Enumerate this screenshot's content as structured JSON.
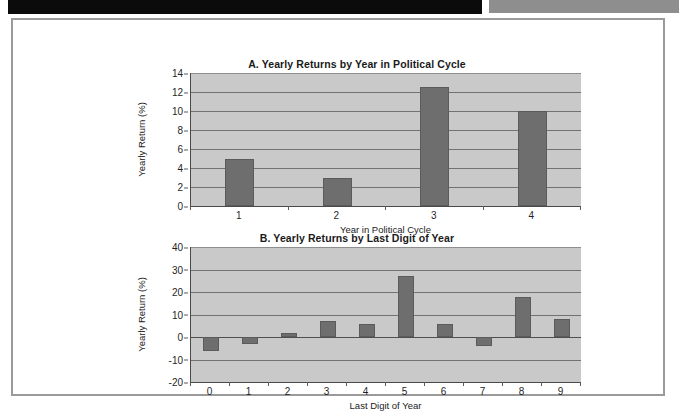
{
  "scan": {
    "black_strip": "scan-artifact-dark",
    "gray_strip": "scan-artifact-gray"
  },
  "chart_data": [
    {
      "id": "chart-a",
      "type": "bar",
      "title": "A. Yearly Returns by Year in Political Cycle",
      "xlabel": "Year in Political Cycle",
      "ylabel": "Yearly Return (%)",
      "categories": [
        "1",
        "2",
        "3",
        "4"
      ],
      "values": [
        5.0,
        3.0,
        12.5,
        10.0
      ],
      "yticks": [
        0,
        2,
        4,
        6,
        8,
        10,
        12,
        14
      ],
      "ylim": [
        0,
        14
      ],
      "grid": true,
      "legend": "none",
      "bar_color": "#6e6e6e",
      "plot_bg": "#c9c9c9"
    },
    {
      "id": "chart-b",
      "type": "bar",
      "title": "B. Yearly Returns by Last Digit of Year",
      "xlabel": "Last Digit of Year",
      "ylabel": "Yearly Return (%)",
      "categories": [
        "0",
        "1",
        "2",
        "3",
        "4",
        "5",
        "6",
        "7",
        "8",
        "9"
      ],
      "values": [
        -6,
        -3,
        2,
        7,
        6,
        27,
        6,
        -4,
        18,
        8
      ],
      "yticks": [
        -20,
        -10,
        0,
        10,
        20,
        30,
        40
      ],
      "ylim": [
        -20,
        40
      ],
      "grid": true,
      "legend": "none",
      "bar_color": "#6e6e6e",
      "plot_bg": "#c9c9c9"
    }
  ]
}
